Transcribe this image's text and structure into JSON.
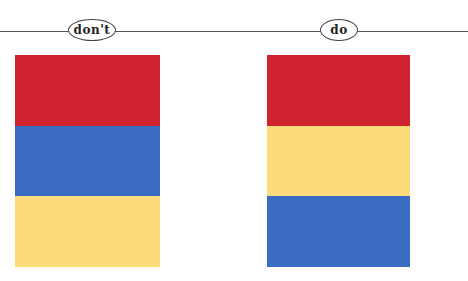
{
  "header": {
    "left_label": "don't",
    "right_label": "do"
  },
  "colors": {
    "red": "#d0232f",
    "blue": "#3a6cc4",
    "yellow": "#fbdb7a",
    "line": "#555555"
  },
  "panels": [
    {
      "label": "don't",
      "stripes": [
        "red",
        "blue",
        "yellow"
      ]
    },
    {
      "label": "do",
      "stripes": [
        "red",
        "yellow",
        "blue"
      ]
    }
  ]
}
